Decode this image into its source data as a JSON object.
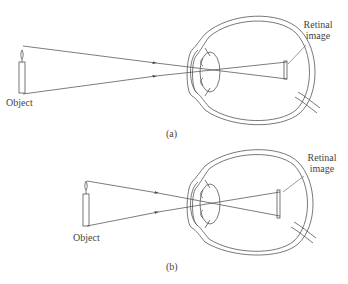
{
  "panels": [
    {
      "id": "a",
      "caption": "(a)",
      "object_label": "Object",
      "retina_label_line1": "Retinal",
      "retina_label_line2": "image"
    },
    {
      "id": "b",
      "caption": "(b)",
      "object_label": "Object",
      "retina_label_line1": "Retinal",
      "retina_label_line2": "image"
    }
  ],
  "colors": {
    "stroke": "#555555",
    "text": "#444444",
    "background": "#ffffff"
  }
}
